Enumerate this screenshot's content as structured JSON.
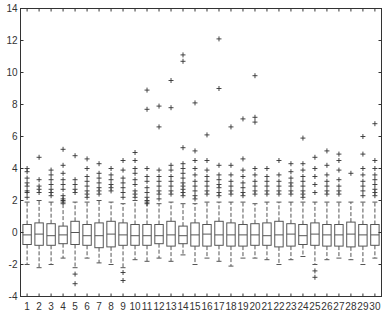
{
  "chart_data": {
    "type": "boxplot",
    "title": "",
    "xlabel": "",
    "ylabel": "",
    "ylim": [
      -4,
      14
    ],
    "yticks": [
      -4,
      -2,
      0,
      2,
      4,
      6,
      8,
      10,
      12,
      14
    ],
    "categories": [
      "1",
      "2",
      "3",
      "4",
      "5",
      "6",
      "7",
      "8",
      "9",
      "10",
      "11",
      "12",
      "13",
      "14",
      "15",
      "16",
      "17",
      "18",
      "19",
      "20",
      "21",
      "22",
      "23",
      "24",
      "25",
      "26",
      "27",
      "28",
      "29",
      "30"
    ],
    "grid": false,
    "colors": {
      "box": "#555555",
      "outlier": "#333333",
      "axis": "#333333"
    },
    "boxes": [
      {
        "q1": -0.75,
        "median": -0.15,
        "q3": 0.5,
        "lo": -2.0,
        "hi": 1.9,
        "outliers": [
          2.2,
          2.5,
          2.6,
          2.9,
          3.1,
          3.4,
          3.8,
          4.0
        ]
      },
      {
        "q1": -0.8,
        "median": -0.1,
        "q3": 0.6,
        "lo": -2.2,
        "hi": 2.0,
        "outliers": [
          2.5,
          2.7,
          2.9,
          3.3,
          4.7
        ]
      },
      {
        "q1": -0.8,
        "median": -0.2,
        "q3": 0.55,
        "lo": -2.0,
        "hi": 1.9,
        "outliers": [
          2.3,
          2.5,
          2.7,
          3.0,
          3.3,
          3.6,
          3.9
        ]
      },
      {
        "q1": -0.7,
        "median": -0.15,
        "q3": 0.4,
        "lo": -1.6,
        "hi": 1.8,
        "outliers": [
          1.9,
          2.0,
          2.1,
          2.3,
          2.7,
          3.0,
          3.3,
          3.7,
          4.2,
          5.2
        ]
      },
      {
        "q1": -0.75,
        "median": 0.0,
        "q3": 0.7,
        "lo": -2.2,
        "hi": 1.9,
        "outliers": [
          -2.6,
          -3.2,
          2.5,
          2.7,
          3.0,
          3.3,
          4.8
        ]
      },
      {
        "q1": -0.8,
        "median": -0.2,
        "q3": 0.5,
        "lo": -1.6,
        "hi": 1.9,
        "outliers": [
          2.2,
          2.4,
          2.6,
          2.9,
          3.2,
          3.5,
          4.0,
          4.6
        ]
      },
      {
        "q1": -0.95,
        "median": -0.2,
        "q3": 0.6,
        "lo": -1.9,
        "hi": 2.0,
        "outliers": [
          2.4,
          2.6,
          2.8,
          3.1,
          3.4,
          3.7,
          4.3
        ]
      },
      {
        "q1": -0.9,
        "median": -0.1,
        "q3": 0.7,
        "lo": -2.0,
        "hi": 1.9,
        "outliers": [
          2.6,
          2.8,
          3.0,
          3.3,
          3.6,
          4.0
        ]
      },
      {
        "q1": -0.8,
        "median": -0.15,
        "q3": 0.6,
        "lo": -2.2,
        "hi": 1.8,
        "outliers": [
          -2.5,
          -3.0,
          2.2,
          2.5,
          2.8,
          3.1,
          3.4,
          3.9,
          4.5
        ]
      },
      {
        "q1": -0.8,
        "median": -0.2,
        "q3": 0.5,
        "lo": -1.7,
        "hi": 2.0,
        "outliers": [
          2.2,
          2.4,
          2.6,
          3.0,
          3.3,
          3.7,
          4.0,
          4.5,
          5.0
        ]
      },
      {
        "q1": -0.8,
        "median": -0.2,
        "q3": 0.5,
        "lo": -1.8,
        "hi": 1.9,
        "outliers": [
          1.8,
          2.0,
          2.2,
          2.5,
          2.8,
          3.2,
          3.5,
          4.0,
          7.7,
          8.9
        ]
      },
      {
        "q1": -0.7,
        "median": -0.2,
        "q3": 0.5,
        "lo": -1.6,
        "hi": 1.8,
        "outliers": [
          2.1,
          2.4,
          2.6,
          2.9,
          3.2,
          3.5,
          3.9,
          6.6,
          7.9
        ]
      },
      {
        "q1": -0.85,
        "median": -0.15,
        "q3": 0.7,
        "lo": -1.8,
        "hi": 1.9,
        "outliers": [
          2.4,
          2.6,
          2.9,
          3.2,
          3.5,
          3.9,
          4.2,
          7.8,
          9.5
        ]
      },
      {
        "q1": -0.7,
        "median": -0.2,
        "q3": 0.4,
        "lo": -1.4,
        "hi": 1.8,
        "outliers": [
          2.3,
          2.5,
          2.7,
          2.9,
          3.1,
          3.4,
          3.7,
          4.0,
          4.3,
          5.3,
          10.7,
          11.1
        ]
      },
      {
        "q1": -0.85,
        "median": -0.15,
        "q3": 0.6,
        "lo": -2.0,
        "hi": 1.8,
        "outliers": [
          2.1,
          2.3,
          2.6,
          2.9,
          3.2,
          3.6,
          4.0,
          4.5,
          5.1,
          8.1
        ]
      },
      {
        "q1": -0.85,
        "median": -0.1,
        "q3": 0.5,
        "lo": -1.6,
        "hi": 1.9,
        "outliers": [
          2.4,
          2.6,
          2.9,
          3.2,
          3.5,
          3.9,
          4.5,
          6.1
        ]
      },
      {
        "q1": -0.8,
        "median": -0.15,
        "q3": 0.7,
        "lo": -1.8,
        "hi": 1.9,
        "outliers": [
          2.3,
          2.5,
          2.8,
          3.0,
          3.3,
          3.6,
          4.2,
          9.0,
          12.1
        ]
      },
      {
        "q1": -0.85,
        "median": -0.15,
        "q3": 0.6,
        "lo": -2.1,
        "hi": 1.9,
        "outliers": [
          2.4,
          2.6,
          2.9,
          3.2,
          3.6,
          4.2,
          6.6
        ]
      },
      {
        "q1": -0.85,
        "median": -0.15,
        "q3": 0.5,
        "lo": -1.6,
        "hi": 1.9,
        "outliers": [
          2.3,
          2.5,
          2.8,
          3.1,
          3.5,
          3.9,
          4.6,
          7.1
        ]
      },
      {
        "q1": -0.8,
        "median": -0.15,
        "q3": 0.55,
        "lo": -1.6,
        "hi": 1.8,
        "outliers": [
          2.4,
          2.6,
          2.9,
          3.2,
          3.6,
          4.0,
          6.9,
          7.2,
          9.8
        ]
      },
      {
        "q1": -0.8,
        "median": -0.2,
        "q3": 0.6,
        "lo": -1.7,
        "hi": 1.9,
        "outliers": [
          2.4,
          2.6,
          2.9,
          3.2,
          3.5,
          4.0
        ]
      },
      {
        "q1": -0.9,
        "median": -0.15,
        "q3": 0.7,
        "lo": -2.0,
        "hi": 1.9,
        "outliers": [
          2.4,
          2.6,
          2.9,
          3.2,
          3.6,
          4.5
        ]
      },
      {
        "q1": -0.85,
        "median": -0.1,
        "q3": 0.55,
        "lo": -1.7,
        "hi": 1.9,
        "outliers": [
          2.4,
          2.6,
          2.9,
          3.1,
          3.4,
          3.8,
          4.3
        ]
      },
      {
        "q1": -0.75,
        "median": -0.2,
        "q3": 0.5,
        "lo": -1.5,
        "hi": 1.9,
        "outliers": [
          2.2,
          2.4,
          2.6,
          2.9,
          3.2,
          3.5,
          3.9,
          4.3,
          5.9
        ]
      },
      {
        "q1": -0.8,
        "median": -0.1,
        "q3": 0.6,
        "lo": -2.0,
        "hi": 1.9,
        "outliers": [
          -2.4,
          -2.8,
          2.5,
          3.0,
          3.5,
          4.0,
          4.7
        ]
      },
      {
        "q1": -0.85,
        "median": -0.15,
        "q3": 0.5,
        "lo": -1.7,
        "hi": 1.9,
        "outliers": [
          2.4,
          2.6,
          2.9,
          3.2,
          3.6,
          4.2,
          5.1
        ]
      },
      {
        "q1": -0.85,
        "median": -0.15,
        "q3": 0.5,
        "lo": -1.6,
        "hi": 1.9,
        "outliers": [
          2.4,
          2.6,
          2.9,
          3.3,
          3.9,
          4.5,
          4.9
        ]
      },
      {
        "q1": -0.9,
        "median": -0.1,
        "q3": 0.65,
        "lo": -1.7,
        "hi": 1.9,
        "outliers": [
          3.7
        ]
      },
      {
        "q1": -0.85,
        "median": -0.15,
        "q3": 0.5,
        "lo": -2.0,
        "hi": 1.9,
        "outliers": [
          2.3,
          2.6,
          2.9,
          3.2,
          3.6,
          4.0,
          4.9,
          6.0
        ]
      },
      {
        "q1": -0.8,
        "median": -0.15,
        "q3": 0.5,
        "lo": -1.6,
        "hi": 1.9,
        "outliers": [
          2.3,
          2.5,
          2.7,
          3.0,
          3.3,
          3.6,
          4.0,
          4.5,
          6.8
        ]
      }
    ]
  }
}
